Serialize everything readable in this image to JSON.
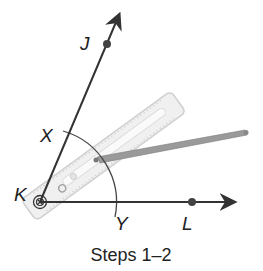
{
  "diagram": {
    "caption": "Steps 1–2",
    "labels": {
      "J": "J",
      "K": "K",
      "L": "L",
      "X": "X",
      "Y": "Y"
    },
    "colors": {
      "line": "#333333",
      "ruler_fill": "#eeeeee",
      "ruler_edge": "#cfcfcf",
      "pencil": "#8a8a8a"
    }
  }
}
